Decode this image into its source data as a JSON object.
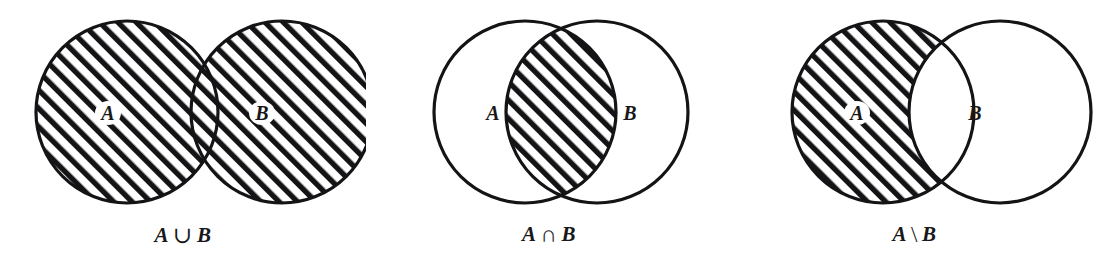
{
  "figure": {
    "background_color": "#ffffff",
    "ink_color": "#141416",
    "width": 1097,
    "height": 267
  },
  "panels": [
    {
      "id": "union",
      "caption_left": "A",
      "caption_op": "∪",
      "caption_right": "B",
      "caption_text": "A ∪ B",
      "label_a": "A",
      "label_b": "B",
      "shaded_region": "both-circles",
      "geometry": {
        "cx_a": 127,
        "cx_b": 282,
        "cy": 112,
        "r": 91,
        "label_a_x": 108,
        "label_a_y": 120,
        "label_b_x": 262,
        "label_b_y": 120
      }
    },
    {
      "id": "intersection",
      "caption_left": "A",
      "caption_op": "∩",
      "caption_right": "B",
      "caption_text": "A ∩ B",
      "label_a": "A",
      "label_b": "B",
      "shaded_region": "lens-overlap",
      "geometry": {
        "cx_a": 525,
        "cx_b": 597,
        "cy": 112,
        "r": 91,
        "label_a_x": 493,
        "label_a_y": 120,
        "label_b_x": 630,
        "label_b_y": 120
      }
    },
    {
      "id": "difference",
      "caption_left": "A",
      "caption_op": "\\",
      "caption_right": "B",
      "caption_text": "A \\ B",
      "label_a": "A",
      "label_b": "B",
      "shaded_region": "a-minus-b",
      "geometry": {
        "cx_a": 883,
        "cx_b": 1000,
        "cy": 112,
        "r": 91,
        "label_a_x": 857,
        "label_a_y": 120,
        "label_b_x": 975,
        "label_b_y": 120
      }
    }
  ]
}
